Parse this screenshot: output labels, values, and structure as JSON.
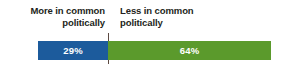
{
  "chart_data": {
    "type": "bar",
    "orientation": "horizontal-stacked",
    "title": "",
    "xlabel": "",
    "ylabel": "",
    "grid": false,
    "legend_position": "top",
    "categories": [
      "More in common politically",
      "Less in common politically"
    ],
    "values": [
      29,
      64
    ],
    "value_labels": [
      "29%",
      "64%"
    ],
    "colors": [
      "#1c5b9c",
      "#5b9a2c"
    ],
    "axis_divider": true,
    "divider_color": "#5c4a42"
  },
  "labels": {
    "left": {
      "line1": "More in common",
      "line2": "politically"
    },
    "right": {
      "line1": "Less in common",
      "line2": "politically"
    }
  },
  "segments": {
    "more": {
      "name": "More in common politically",
      "value_label": "29%",
      "color": "#1c5b9c"
    },
    "less": {
      "name": "Less in common politically",
      "value_label": "64%",
      "color": "#5b9a2c"
    }
  }
}
